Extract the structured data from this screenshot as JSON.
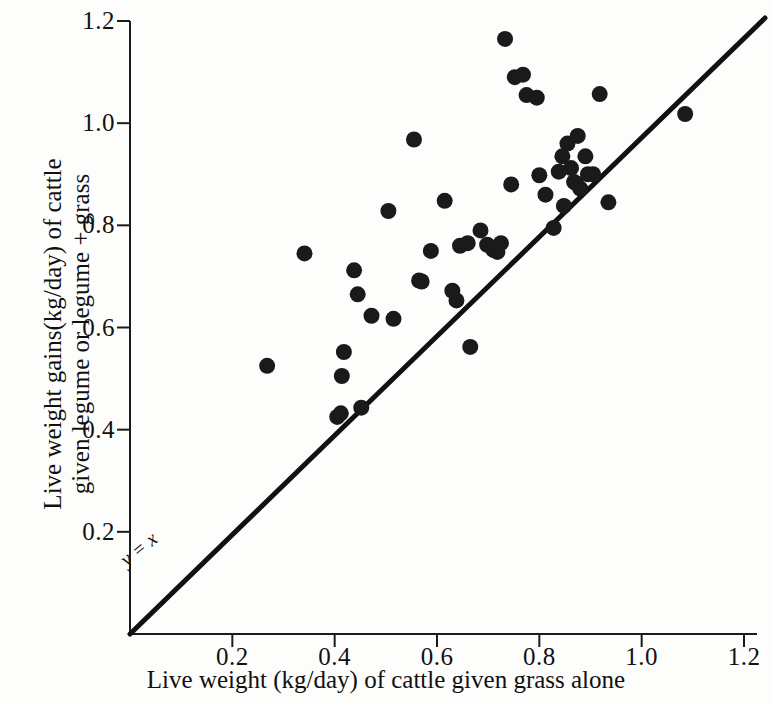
{
  "figure": {
    "background_color": "#fdfdfc",
    "foreground_color": "#111111",
    "marker_color": "#1a1a1a"
  },
  "axes": {
    "x_title": "Live weight (kg/day) of cattle given grass alone",
    "y_title_line1": "Live weight gains(kg/day) of cattle",
    "y_title_line2": "given legume or legume + grass",
    "x_ticks": [
      "0.2",
      "0.4",
      "0.6",
      "0.8",
      "1.0",
      "1.2"
    ],
    "y_ticks": [
      "0.2",
      "0.4",
      "0.6",
      "0.8",
      "1.0",
      "1.2"
    ]
  },
  "annotations": {
    "identity_line": "y = x"
  },
  "chart_data": {
    "type": "scatter",
    "title": "",
    "xlabel": "Live weight (kg/day) of cattle given grass alone",
    "ylabel": "Live weight gains(kg/day) of cattle given legume or legume + grass",
    "xlim": [
      0,
      1.2
    ],
    "ylim": [
      0,
      1.2
    ],
    "xticks": [
      0.2,
      0.4,
      0.6,
      0.8,
      1.0,
      1.2
    ],
    "yticks": [
      0.2,
      0.4,
      0.6,
      0.8,
      1.0,
      1.2
    ],
    "grid": false,
    "legend": false,
    "reference_line": {
      "label": "y = x",
      "slope": 1,
      "intercept": 0,
      "from": [
        0,
        0
      ],
      "to": [
        1.2,
        1.2
      ]
    },
    "points": [
      [
        0.268,
        0.525
      ],
      [
        0.341,
        0.745
      ],
      [
        0.405,
        0.425
      ],
      [
        0.412,
        0.432
      ],
      [
        0.414,
        0.505
      ],
      [
        0.418,
        0.552
      ],
      [
        0.438,
        0.712
      ],
      [
        0.445,
        0.665
      ],
      [
        0.452,
        0.443
      ],
      [
        0.472,
        0.623
      ],
      [
        0.505,
        0.828
      ],
      [
        0.515,
        0.617
      ],
      [
        0.555,
        0.968
      ],
      [
        0.565,
        0.692
      ],
      [
        0.57,
        0.69
      ],
      [
        0.588,
        0.75
      ],
      [
        0.615,
        0.848
      ],
      [
        0.63,
        0.672
      ],
      [
        0.638,
        0.653
      ],
      [
        0.645,
        0.76
      ],
      [
        0.66,
        0.765
      ],
      [
        0.665,
        0.562
      ],
      [
        0.685,
        0.79
      ],
      [
        0.698,
        0.762
      ],
      [
        0.71,
        0.752
      ],
      [
        0.718,
        0.748
      ],
      [
        0.725,
        0.765
      ],
      [
        0.733,
        1.165
      ],
      [
        0.745,
        0.88
      ],
      [
        0.752,
        1.09
      ],
      [
        0.768,
        1.095
      ],
      [
        0.775,
        1.055
      ],
      [
        0.795,
        1.05
      ],
      [
        0.8,
        0.898
      ],
      [
        0.812,
        0.86
      ],
      [
        0.828,
        0.795
      ],
      [
        0.838,
        0.905
      ],
      [
        0.845,
        0.935
      ],
      [
        0.848,
        0.838
      ],
      [
        0.855,
        0.96
      ],
      [
        0.862,
        0.912
      ],
      [
        0.868,
        0.885
      ],
      [
        0.872,
        0.882
      ],
      [
        0.875,
        0.975
      ],
      [
        0.88,
        0.872
      ],
      [
        0.89,
        0.935
      ],
      [
        0.895,
        0.9
      ],
      [
        0.905,
        0.9
      ],
      [
        0.918,
        1.057
      ],
      [
        0.935,
        0.845
      ],
      [
        1.085,
        1.018
      ]
    ]
  }
}
